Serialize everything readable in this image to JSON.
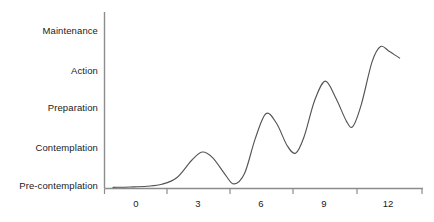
{
  "chart_data": {
    "type": "line",
    "title": "",
    "subtitle": "",
    "xlabel": "",
    "ylabel": "",
    "grid": false,
    "legend": null,
    "legend_position": "none",
    "line_color": "#555555",
    "axis_color": "#8c8c8c",
    "background_color": "#ffffff",
    "x": {
      "ticks": [
        0,
        3,
        6,
        9,
        12
      ],
      "tick_labels": [
        "0",
        "3",
        "6",
        "9",
        "12"
      ],
      "range": [
        -1.5,
        13.5
      ]
    },
    "y": {
      "categories": [
        "Pre-contemplation",
        "Contemplation",
        "Preparation",
        "Action",
        "Maintenance"
      ],
      "tick_labels": [
        "Pre-contemplation",
        "Contemplation",
        "Preparation",
        "Action",
        "Maintenance"
      ],
      "range": [
        0,
        4.6
      ]
    },
    "series": [
      {
        "name": "Stage of change progression",
        "points": [
          {
            "x": -1.1,
            "y": 0.03
          },
          {
            "x": -0.3,
            "y": 0.04
          },
          {
            "x": 0.5,
            "y": 0.06
          },
          {
            "x": 1.2,
            "y": 0.11
          },
          {
            "x": 1.9,
            "y": 0.28
          },
          {
            "x": 2.6,
            "y": 0.73
          },
          {
            "x": 3.1,
            "y": 0.95
          },
          {
            "x": 3.6,
            "y": 0.8
          },
          {
            "x": 4.2,
            "y": 0.35
          },
          {
            "x": 4.6,
            "y": 0.12
          },
          {
            "x": 5.1,
            "y": 0.4
          },
          {
            "x": 5.6,
            "y": 1.3
          },
          {
            "x": 6.1,
            "y": 1.95
          },
          {
            "x": 6.6,
            "y": 1.7
          },
          {
            "x": 7.1,
            "y": 1.12
          },
          {
            "x": 7.5,
            "y": 0.92
          },
          {
            "x": 7.9,
            "y": 1.35
          },
          {
            "x": 8.4,
            "y": 2.3
          },
          {
            "x": 8.9,
            "y": 2.8
          },
          {
            "x": 9.4,
            "y": 2.35
          },
          {
            "x": 9.9,
            "y": 1.75
          },
          {
            "x": 10.2,
            "y": 1.62
          },
          {
            "x": 10.6,
            "y": 2.2
          },
          {
            "x": 11.1,
            "y": 3.3
          },
          {
            "x": 11.5,
            "y": 3.7
          },
          {
            "x": 11.9,
            "y": 3.58
          },
          {
            "x": 12.4,
            "y": 3.4
          }
        ]
      }
    ]
  },
  "y_axis": {
    "labels": [
      {
        "text": "Maintenance",
        "top_px": 26
      },
      {
        "text": "Action",
        "top_px": 66
      },
      {
        "text": "Preparation",
        "top_px": 103
      },
      {
        "text": "Contemplation",
        "top_px": 143
      },
      {
        "text": "Pre-contemplation",
        "top_px": 181
      }
    ]
  },
  "x_axis": {
    "labels": [
      {
        "text": "0",
        "left_px": 136
      },
      {
        "text": "3",
        "left_px": 198
      },
      {
        "text": "6",
        "left_px": 261
      },
      {
        "text": "9",
        "left_px": 324
      },
      {
        "text": "12",
        "left_px": 388
      }
    ]
  }
}
